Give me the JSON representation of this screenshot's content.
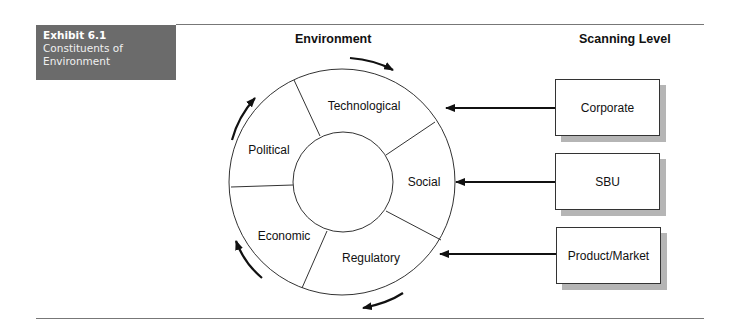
{
  "exhibit": {
    "number": "Exhibit 6.1",
    "caption_line1": "Constituents of",
    "caption_line2": "Environment"
  },
  "headers": {
    "environment": "Environment",
    "scanning_level": "Scanning Level"
  },
  "environment_segments": {
    "technological": "Technological",
    "political": "Political",
    "social": "Social",
    "economic": "Economic",
    "regulatory": "Regulatory"
  },
  "scanning_levels": [
    {
      "label": "Corporate",
      "arrow_target": "Technological"
    },
    {
      "label": "SBU",
      "arrow_target": "Social"
    },
    {
      "label": "Product/Market",
      "arrow_target": "Regulatory"
    }
  ],
  "colors": {
    "exhibit_bg": "#6b6b6b",
    "line": "#333333",
    "shadow": "#b5b5b5",
    "rule": "#777777"
  }
}
